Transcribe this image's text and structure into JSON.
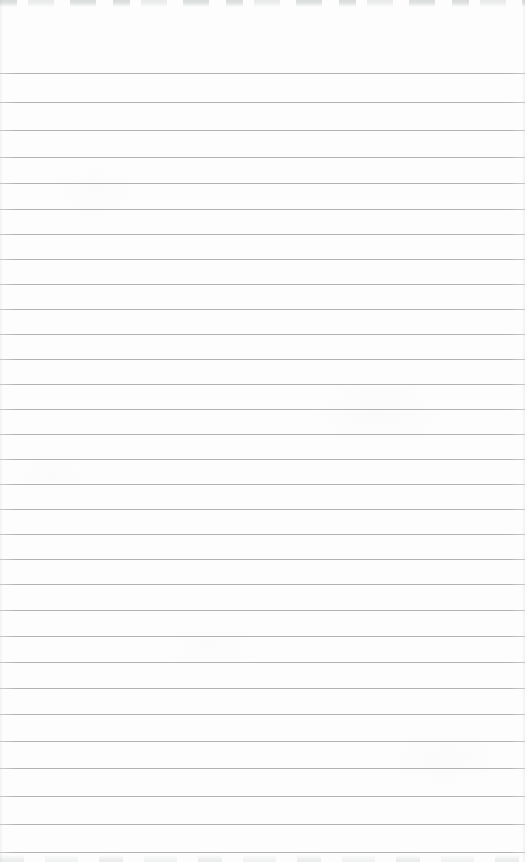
{
  "document": {
    "type": "scanned blank ruled notebook page",
    "text_content": "",
    "page": {
      "background_color": "#fdfdfd",
      "rule_color": "#a6a9a8",
      "edge_mark_color": "#c3c8c8",
      "ruled_lines": {
        "count": 31,
        "orientation": "horizontal",
        "full_width": true,
        "y_positions": [
          73,
          102,
          130,
          157,
          183,
          209,
          234,
          259,
          284,
          309,
          334,
          359,
          384,
          409,
          434,
          459,
          484,
          509,
          534,
          559,
          584,
          610,
          636,
          662,
          688,
          714,
          741,
          768,
          796,
          824,
          852
        ]
      }
    }
  }
}
